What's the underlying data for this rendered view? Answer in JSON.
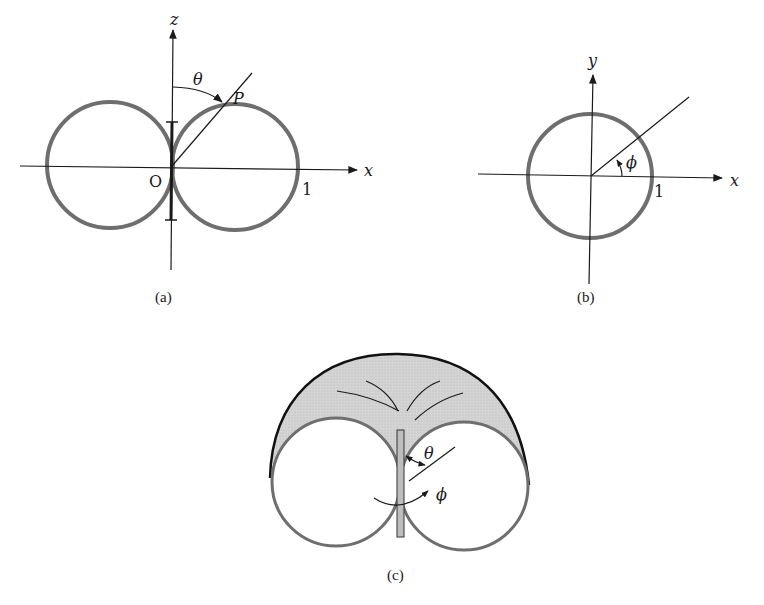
{
  "figure_a": {
    "caption": "(a)",
    "axis_z_label": "z",
    "axis_x_label": "x",
    "origin_label": "O",
    "unit_label": "1",
    "angle_label": "θ",
    "point_label": "P"
  },
  "figure_b": {
    "caption": "(b)",
    "axis_y_label": "y",
    "axis_x_label": "x",
    "unit_label": "1",
    "angle_label": "ϕ"
  },
  "figure_c": {
    "caption": "(c)",
    "theta_label": "θ",
    "phi_label": "ϕ"
  },
  "colors": {
    "curve": "#6e6e6e",
    "axis": "#1a1a1a",
    "shade": "#cfcfcf",
    "outline": "#111111"
  }
}
